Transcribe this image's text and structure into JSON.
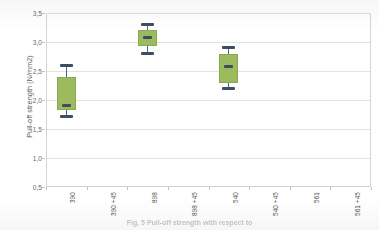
{
  "chart_data": {
    "type": "box",
    "title": "",
    "xlabel": "",
    "ylabel": "Pull-off strength (N/mm2)",
    "ylim": [
      0.5,
      3.5
    ],
    "ytick_labels": [
      "3,5",
      "3,0",
      "2,5",
      "2,0",
      "1,5",
      "1,0",
      "0,5"
    ],
    "ytick_values": [
      3.5,
      3.0,
      2.5,
      2.0,
      1.5,
      1.0,
      0.5
    ],
    "grid": true,
    "legend": "none",
    "categories": [
      "390",
      "390 +45",
      "898",
      "898 +45",
      "540",
      "540 +45",
      "561",
      "561 +45"
    ],
    "boxes": [
      {
        "category": "390",
        "whisker_low": 1.72,
        "q1": 1.82,
        "median": 1.9,
        "q3": 2.4,
        "whisker_high": 2.6
      },
      {
        "category": "390 +45",
        "whisker_low": null,
        "q1": null,
        "median": null,
        "q3": null,
        "whisker_high": null
      },
      {
        "category": "898",
        "whisker_low": 2.8,
        "q1": 2.93,
        "median": 3.08,
        "q3": 3.2,
        "whisker_high": 3.3
      },
      {
        "category": "898 +45",
        "whisker_low": null,
        "q1": null,
        "median": null,
        "q3": null,
        "whisker_high": null
      },
      {
        "category": "540",
        "whisker_low": 2.2,
        "q1": 2.3,
        "median": 2.57,
        "q3": 2.8,
        "whisker_high": 2.9
      },
      {
        "category": "540 +45",
        "whisker_low": null,
        "q1": null,
        "median": null,
        "q3": null,
        "whisker_high": null
      },
      {
        "category": "561",
        "whisker_low": null,
        "q1": null,
        "median": null,
        "q3": null,
        "whisker_high": null
      },
      {
        "category": "561 +45",
        "whisker_low": null,
        "q1": null,
        "median": null,
        "q3": null,
        "whisker_high": null
      }
    ],
    "colors": {
      "box_fill": "#9CBB5E",
      "box_border": "#8AA94F",
      "median": "#3E4D66",
      "whisker": "#51607A",
      "gridline": "#E2E2E2",
      "plot_border": "#D3D3D3",
      "tick_label": "#6B6B6B",
      "axis_title": "#5A5A5A",
      "background": "#FFFFFF"
    }
  },
  "caption": {
    "text": "Fig. 5  Pull-off strength with respect to"
  }
}
